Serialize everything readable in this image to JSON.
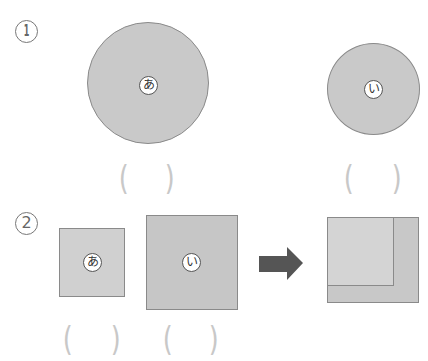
{
  "problems": [
    {
      "number": "1",
      "shapes": [
        {
          "type": "circle",
          "label": "あ",
          "size": "large"
        },
        {
          "type": "circle",
          "label": "い",
          "size": "small"
        }
      ],
      "answer_blanks": [
        {
          "open": "(",
          "close": ")"
        },
        {
          "open": "(",
          "close": ")"
        }
      ]
    },
    {
      "number": "2",
      "shapes": [
        {
          "type": "square",
          "label": "あ",
          "size": "small"
        },
        {
          "type": "square",
          "label": "い",
          "size": "large"
        }
      ],
      "arrow": "right-arrow",
      "overlay": "squares-overlapped",
      "answer_blanks": [
        {
          "open": "(",
          "close": ")"
        },
        {
          "open": "(",
          "close": ")"
        }
      ]
    }
  ],
  "colors": {
    "shape_fill": "#c9c9c9",
    "shape_fill_light": "#d3d3d3",
    "outline": "#8a8a8a",
    "arrow": "#555555",
    "paren": "#c8c8c8"
  }
}
